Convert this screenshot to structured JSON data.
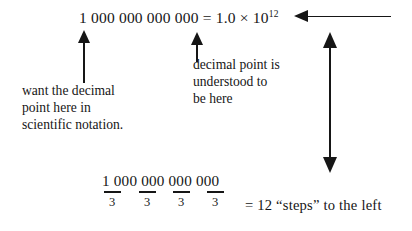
{
  "figure": {
    "equation": {
      "number": "1 000 000 000 000",
      "equals": " = ",
      "coefficient": "1.0 × 10",
      "exponent": "12"
    },
    "annotations": {
      "left": "want the decimal\npoint here in\nscientific notation.",
      "right": "decimal point is\nunderstood to\nbe here"
    },
    "bottom": {
      "number": "1 000 000 000 000",
      "denominators": [
        "3",
        "3",
        "3",
        "3"
      ],
      "result": "= 12 “steps” to the left"
    },
    "arrows": {
      "up_left_name": "arrow-up-to-leading-one",
      "up_middle_name": "arrow-up-to-implied-decimal-point",
      "left_name": "arrow-left-to-exponent",
      "double_name": "arrow-double-vertical-link"
    },
    "colors": {
      "ink": "#161616",
      "background": "#ffffff"
    }
  }
}
